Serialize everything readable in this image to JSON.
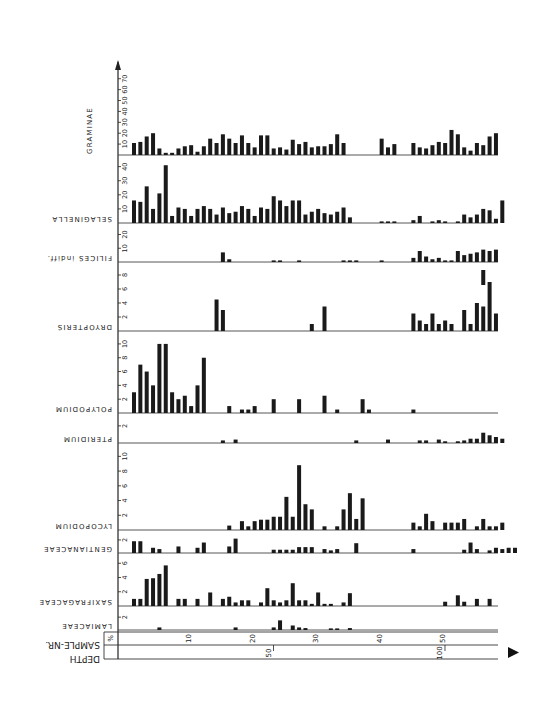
{
  "chart_data": {
    "type": "bar",
    "title": "",
    "subtype": "pollen-diagram (stacked panels, shared x-axis of sample number)",
    "xlabel": "SAMPLE-NR.",
    "x_unit_label": "%",
    "depth_label": "DEPTH",
    "x_ticks": [
      10,
      20,
      30,
      40,
      50
    ],
    "depth_ticks": [
      {
        "label": "50",
        "sample": 22.5
      },
      {
        "label": "100",
        "sample": 49.5
      }
    ],
    "grid": false,
    "legend": "none",
    "samples": [
      1,
      2,
      3,
      4,
      5,
      6,
      7,
      8,
      9,
      10,
      11,
      12,
      13,
      14,
      15,
      16,
      17,
      18,
      19,
      20,
      21,
      22,
      23,
      24,
      25,
      26,
      27,
      28,
      29,
      30,
      31,
      32,
      33,
      34,
      35,
      36,
      37,
      38,
      39,
      40,
      41,
      42,
      43,
      44,
      45,
      46,
      47,
      48,
      49,
      50,
      51,
      52,
      53,
      54,
      55,
      56,
      57,
      58
    ],
    "series": [
      {
        "name": "GRAMINAE",
        "yticks": [
          10,
          20,
          30,
          40,
          50,
          60,
          70
        ],
        "ymax": 78,
        "values": [
          11,
          12,
          17,
          20,
          6,
          2,
          2,
          6,
          8,
          9,
          3,
          8,
          15,
          11,
          19,
          15,
          11,
          18,
          11,
          7,
          18,
          18,
          6,
          7,
          5,
          14,
          10,
          12,
          7,
          8,
          8,
          10,
          19,
          11,
          0,
          0,
          0,
          0,
          0,
          15,
          7,
          10,
          0,
          0,
          11,
          7,
          6,
          9,
          12,
          11,
          23,
          19,
          7,
          4,
          11,
          9,
          17,
          20
        ]
      },
      {
        "name": "SELAGINELLA",
        "yticks": [
          10,
          20,
          30,
          40
        ],
        "ymax": 44,
        "values": [
          16,
          15,
          26,
          10,
          21,
          41,
          5,
          11,
          10,
          5,
          10,
          12,
          10,
          6,
          11,
          7,
          8,
          12,
          10,
          5,
          11,
          10,
          19,
          16,
          12,
          16,
          16,
          6,
          8,
          10,
          7,
          6,
          8,
          11,
          4,
          0,
          0,
          0,
          0,
          1,
          1,
          1,
          0,
          0,
          2,
          5,
          0,
          1,
          2,
          1,
          0,
          1,
          6,
          4,
          6,
          10,
          9,
          3,
          16
        ]
      },
      {
        "name": "FILICES indiff.",
        "yticks": [
          10,
          20
        ],
        "ymax": 24,
        "values": [
          0,
          0,
          0,
          0,
          0,
          0,
          0,
          0,
          0,
          0,
          0,
          0,
          0,
          0,
          7,
          2,
          0,
          0,
          0,
          0,
          0,
          0,
          1,
          1,
          0,
          0,
          1,
          0,
          0,
          0,
          0,
          0,
          0,
          1,
          1,
          1,
          0,
          0,
          0,
          1,
          0,
          0,
          0,
          0,
          3,
          8,
          4,
          2,
          3,
          1,
          1,
          8,
          5,
          6,
          7,
          9,
          8,
          9
        ]
      },
      {
        "name": "DRYOPTERIS",
        "yticks": [
          2,
          4,
          6,
          8
        ],
        "ymax": 9,
        "values": [
          0,
          0,
          0,
          0,
          0,
          0,
          0,
          0,
          0,
          0,
          0,
          0,
          0,
          4.5,
          3,
          0,
          0,
          0,
          0,
          0,
          0,
          0,
          0,
          0,
          0,
          0,
          0,
          0,
          1,
          0,
          3.5,
          0,
          0,
          0,
          0,
          0,
          0,
          0,
          0,
          0,
          0,
          0,
          0,
          0,
          2.5,
          1.5,
          1,
          2.5,
          1,
          1.5,
          1,
          0,
          3,
          1,
          4,
          3.5,
          7,
          2.5
        ]
      },
      {
        "name": "POLYPODIUM",
        "yticks": [
          2,
          4,
          6,
          8,
          10
        ],
        "ymax": 11,
        "values": [
          3,
          7,
          6,
          4,
          10,
          10,
          3,
          2,
          2.5,
          1,
          4,
          8,
          0,
          0,
          0,
          1,
          0,
          0.5,
          0.5,
          1,
          0,
          0,
          2,
          0,
          0,
          0,
          2,
          0,
          0,
          0,
          2.5,
          0,
          0.5,
          0,
          0,
          0,
          2,
          0.5,
          0,
          0,
          0,
          0,
          0,
          0,
          0.5,
          0,
          0,
          0,
          0,
          0,
          0,
          0,
          0,
          0,
          0,
          0,
          0,
          0
        ]
      },
      {
        "name": "PTERIDIUM",
        "yticks": [
          2
        ],
        "ymax": 2.8,
        "values": [
          0,
          0,
          0,
          0,
          0,
          0,
          0,
          0,
          0,
          0,
          0,
          0,
          0,
          0,
          0.3,
          0,
          0.4,
          0,
          0,
          0,
          0,
          0,
          0,
          0,
          0,
          0,
          0,
          0,
          0,
          0,
          0,
          0,
          0,
          0,
          0,
          0.3,
          0,
          0,
          0,
          0,
          0.4,
          0,
          0,
          0,
          0,
          0.3,
          0.3,
          0,
          0.4,
          0.2,
          0,
          0.2,
          0.3,
          0.5,
          0.5,
          1.2,
          0.9,
          0.7,
          0.5
        ]
      },
      {
        "name": "LYCOPODIUM",
        "yticks": [
          2,
          4,
          6,
          8,
          10
        ],
        "ymax": 11,
        "values": [
          0,
          0,
          0,
          0,
          0,
          0,
          0,
          0,
          0,
          0,
          0,
          0,
          0,
          0,
          0,
          0.6,
          0,
          1.2,
          0.5,
          1.2,
          1.4,
          1.4,
          1.8,
          1.8,
          4.5,
          1.8,
          8.8,
          3.5,
          2.8,
          0,
          0.5,
          0,
          0.5,
          2.8,
          5,
          1.5,
          4.3,
          0,
          0,
          0,
          0,
          0,
          0,
          0,
          1,
          0.5,
          2.2,
          1.2,
          0,
          1,
          1,
          1,
          1.5,
          0,
          0.5,
          1.5,
          0.5,
          0.5,
          1
        ]
      },
      {
        "name": "GENTIANACEAE",
        "yticks": [
          2
        ],
        "ymax": 2.6,
        "values": [
          1.8,
          1.8,
          0,
          0.8,
          0.6,
          0,
          0,
          1,
          0,
          0,
          0.8,
          1.6,
          0,
          0,
          0,
          1,
          2.2,
          0,
          0,
          0,
          0,
          0,
          0.5,
          0.5,
          0.5,
          0.5,
          0.9,
          0.9,
          0.9,
          0,
          0.6,
          0.4,
          0.6,
          0,
          0,
          1.5,
          0,
          0,
          0,
          0,
          0,
          0,
          0,
          0,
          0.6,
          0,
          0,
          0,
          0,
          0,
          0,
          0,
          0.5,
          1.6,
          0.6,
          0,
          0.4,
          0.8,
          0.6,
          0.8,
          0.8
        ]
      },
      {
        "name": "SAXIFRAGACEAE",
        "yticks": [
          2,
          4,
          6
        ],
        "ymax": 6.6,
        "values": [
          1,
          1,
          3.8,
          3.9,
          4.5,
          5.7,
          0,
          1,
          1,
          0,
          1,
          0,
          1.9,
          0,
          1,
          1.3,
          0.5,
          0.8,
          0.8,
          0,
          0.5,
          2.5,
          0.8,
          0.5,
          0.8,
          3.2,
          0.8,
          0.8,
          0.3,
          1.9,
          0.3,
          0.3,
          0,
          0.5,
          1.8,
          0,
          0,
          0,
          0,
          0,
          0,
          0,
          0,
          0,
          0,
          0,
          0,
          0,
          0,
          0.6,
          0,
          1.5,
          0.6,
          0,
          1,
          0,
          1
        ]
      },
      {
        "name": "LAMIACEAE",
        "yticks": [
          2
        ],
        "ymax": 2.8,
        "values": [
          0,
          0,
          0,
          0,
          0.4,
          0,
          0,
          0,
          0,
          0,
          0,
          0,
          0,
          0,
          0,
          0,
          0.4,
          0,
          0,
          0,
          0,
          0,
          0.4,
          1.5,
          0,
          0.7,
          0.4,
          0.3,
          0,
          0,
          0,
          0.2,
          0.2,
          0,
          0.3,
          0,
          0,
          0,
          0,
          0,
          0,
          0,
          0,
          0,
          0,
          0,
          0,
          0,
          0,
          0,
          0,
          0,
          0,
          0,
          0,
          0,
          0,
          0
        ]
      }
    ]
  },
  "labels": {
    "percent": "%",
    "sample_nr": "SAMPLE-NR.",
    "depth": "DEPTH",
    "depth_50": "50",
    "depth_100": "100"
  }
}
